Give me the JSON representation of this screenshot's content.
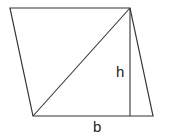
{
  "diagram": {
    "labels": {
      "height": "h",
      "base": "b"
    },
    "colors": {
      "stroke": "#333333",
      "background": "#ffffff"
    }
  }
}
